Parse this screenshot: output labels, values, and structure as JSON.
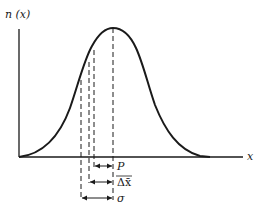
{
  "figure": {
    "y_axis_label": "n (x)",
    "x_axis_label": "x",
    "curve": "bell-shaped distribution n(x)",
    "markers": [
      {
        "label": "P",
        "description": "interval from inner dashed line to peak"
      },
      {
        "label": "Δx̄",
        "description": "interval from second dashed line to peak"
      },
      {
        "label": "σ",
        "description": "interval from outermost dashed line to peak"
      }
    ],
    "colors": {
      "ink": "#1a1a1a",
      "background": "#ffffff"
    }
  }
}
